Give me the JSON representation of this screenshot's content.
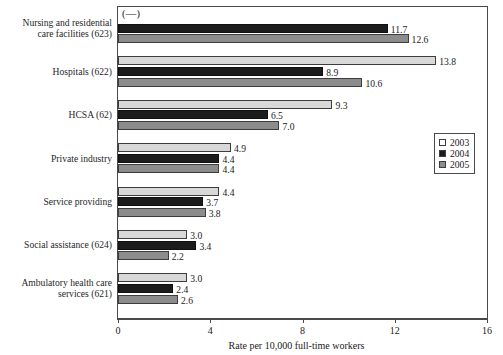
{
  "chart_data": {
    "type": "bar",
    "orientation": "horizontal",
    "title": "",
    "xlabel": "Rate per 10,000 full-time workers",
    "ylabel": "",
    "xlim": [
      0,
      16
    ],
    "xticks": [
      "0",
      "4",
      "8",
      "12",
      "16"
    ],
    "grid": false,
    "legend_position": "right-middle",
    "annotations": [
      {
        "name": "missing-data-marker",
        "text": "(—)"
      }
    ],
    "categories": [
      "Nursing and residential\ncare facilities (623)",
      "Hospitals (622)",
      "HCSA (62)",
      "Private industry",
      "Service providing",
      "Social assistance (624)",
      "Ambulatory health care\nservices (621)"
    ],
    "series": [
      {
        "name": "2003",
        "color": "#d8d8d8",
        "values": [
          null,
          13.8,
          9.3,
          4.9,
          4.4,
          3.0,
          3.0
        ],
        "labels": [
          "",
          "13.8",
          "9.3",
          "4.9",
          "4.4",
          "3.0",
          "3.0"
        ]
      },
      {
        "name": "2004",
        "color": "#1c1c1c",
        "values": [
          11.7,
          8.9,
          6.5,
          4.4,
          3.7,
          3.4,
          2.4
        ],
        "labels": [
          "11.7",
          "8.9",
          "6.5",
          "4.4",
          "3.7",
          "3.4",
          "2.4"
        ]
      },
      {
        "name": "2005",
        "color": "#8c8c8c",
        "values": [
          12.6,
          10.6,
          7.0,
          4.4,
          3.8,
          2.2,
          2.6
        ],
        "labels": [
          "12.6",
          "10.6",
          "7.0",
          "4.4",
          "3.8",
          "2.2",
          "2.6"
        ]
      }
    ]
  },
  "legend": {
    "items": [
      {
        "label": "2003"
      },
      {
        "label": "2004"
      },
      {
        "label": "2005"
      }
    ]
  }
}
